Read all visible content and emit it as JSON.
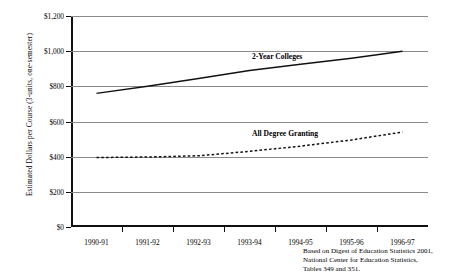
{
  "chart_data": {
    "type": "line",
    "title": "",
    "xlabel": "",
    "ylabel": "Estimated Dollars per Course (3-units, one-semester)",
    "categories": [
      "1990-91",
      "1991-92",
      "1992-93",
      "1993-94",
      "1994-95",
      "1995-96",
      "1996-97"
    ],
    "ylim": [
      0,
      1200
    ],
    "ytick_labels": [
      "$0",
      "$200",
      "$400",
      "$600",
      "$800",
      "$1,000",
      "$1,200"
    ],
    "ytick_values": [
      0,
      200,
      400,
      600,
      800,
      1000,
      1200
    ],
    "grid": true,
    "legend_position": "inline-right",
    "series": [
      {
        "name": "2-Year Colleges",
        "style": "solid",
        "color": "#111111",
        "values": [
          760,
          800,
          845,
          890,
          925,
          960,
          1000
        ]
      },
      {
        "name": "All Degree Granting",
        "style": "dashed",
        "color": "#111111",
        "values": [
          395,
          398,
          405,
          430,
          460,
          495,
          540
        ]
      }
    ],
    "annotations": [
      "Based on Digest of Education Statistics 2001,",
      "National Center for Education Statistics,",
      "Tables 349 and 351."
    ]
  },
  "source_note": {
    "line1": "Based on Digest of Education Statistics 2001,",
    "line2": "National Center for Education Statistics,",
    "line3": "Tables 349 and 351."
  }
}
